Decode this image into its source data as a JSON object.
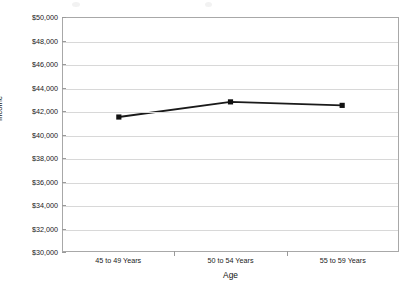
{
  "chart_data": {
    "type": "line",
    "title": "",
    "xlabel": "Age",
    "ylabel": "Income",
    "categories": [
      "45 to 49 Years",
      "50 to 54 Years",
      "55 to 59 Years"
    ],
    "values": [
      41500,
      42800,
      42500
    ],
    "series": [
      {
        "name": "Income",
        "values": [
          41500,
          42800,
          42500
        ]
      }
    ],
    "ylim": [
      30000,
      50000
    ],
    "ytick_step": 2000,
    "ytick_labels": [
      "$50,000",
      "$48,000",
      "$46,000",
      "$44,000",
      "$42,000",
      "$40,000",
      "$38,000",
      "$36,000",
      "$34,000",
      "$32,000",
      "$30,000"
    ],
    "ytick_values": [
      50000,
      48000,
      46000,
      44000,
      42000,
      40000,
      38000,
      36000,
      34000,
      32000,
      30000
    ],
    "grid": "horizontal",
    "legend": "none",
    "line_color": "#1a1a1a",
    "marker": "square",
    "marker_color": "#111111",
    "gridline_color": "#d8d8d8",
    "plot_border_color": "#a8a8a8",
    "background_color": "#ffffff"
  },
  "axes": {
    "y_title": "Income",
    "x_title": "Age"
  }
}
